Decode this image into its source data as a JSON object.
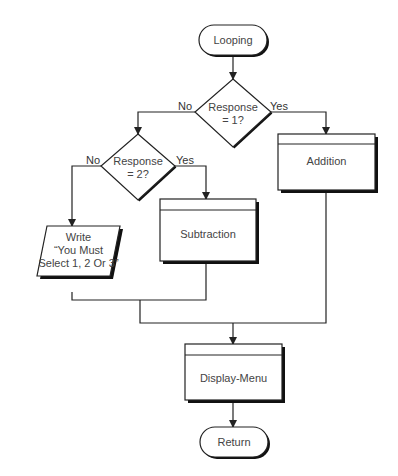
{
  "diagram": {
    "type": "flowchart",
    "nodes": {
      "start": {
        "shape": "terminator",
        "label": "Looping"
      },
      "decision1": {
        "shape": "decision",
        "label_line1": "Response",
        "label_line2": "= 1?"
      },
      "decision2": {
        "shape": "decision",
        "label_line1": "Response",
        "label_line2": "= 2?"
      },
      "addition": {
        "shape": "predefined-process",
        "label": "Addition"
      },
      "subtraction": {
        "shape": "predefined-process",
        "label": "Subtraction"
      },
      "write": {
        "shape": "input-output",
        "label_line1": "Write",
        "label_line2": "“You Must",
        "label_line3": "Select 1, 2 Or 3”"
      },
      "display_menu": {
        "shape": "predefined-process",
        "label": "Display-Menu"
      },
      "end": {
        "shape": "terminator",
        "label": "Return"
      }
    },
    "edges": {
      "d1_no": "No",
      "d1_yes": "Yes",
      "d2_no": "No",
      "d2_yes": "Yes"
    },
    "colors": {
      "stroke": "#222222",
      "shadow": "#111111",
      "text": "#444444",
      "background": "#ffffff"
    }
  }
}
